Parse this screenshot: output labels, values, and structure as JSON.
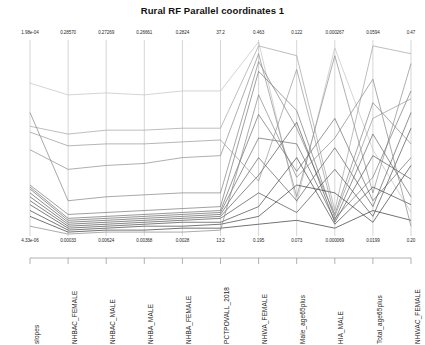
{
  "chart": {
    "title": "Rural RF Parallel coordinates 1"
  },
  "chart_data": {
    "type": "line",
    "subtype": "parallel-coordinates",
    "title": "Rural RF Parallel coordinates 1",
    "xlabel": "",
    "ylabel": "",
    "grid": false,
    "legend": false,
    "axes": [
      {
        "name": "slopes",
        "max": "1.98e-04",
        "min": "4.33e-06"
      },
      {
        "name": "NHBAC_FEMALE",
        "max": "0.28570",
        "min": "0.00033"
      },
      {
        "name": "NHBAC_MALE",
        "max": "0.27269",
        "min": "0.00624"
      },
      {
        "name": "NHBA_MALE",
        "max": "0.26661",
        "min": "0.00368"
      },
      {
        "name": "NHBA_FEMALE",
        "max": "0.2824",
        "min": "0.0028"
      },
      {
        "name": "PCTPOVALL_2018",
        "max": "37.2",
        "min": "13.2"
      },
      {
        "name": "NHWA_FEMALE",
        "max": "0.463",
        "min": "0.195"
      },
      {
        "name": "Male_age65plus",
        "max": "0.122",
        "min": "0.073"
      },
      {
        "name": "HIA_MALE",
        "max": "0.000267",
        "min": "0.000069"
      },
      {
        "name": "Total_age65plus",
        "max": "0.0594",
        "min": "0.0199"
      },
      {
        "name": "NHWAC_FEMALE",
        "max": "0.47",
        "min": "0.20"
      }
    ],
    "categories": [
      "slopes",
      "NHBAC_FEMALE",
      "NHBAC_MALE",
      "NHBA_MALE",
      "NHBA_FEMALE",
      "PCTPOVALL_2018",
      "NHWA_FEMALE",
      "Male_age65plus",
      "HIA_MALE",
      "Total_age65plus",
      "NHWAC_FEMALE"
    ],
    "series": [
      {
        "name": "line-1",
        "shade": 0.2,
        "values": [
          0.78,
          0.72,
          0.73,
          0.72,
          0.74,
          0.74,
          0.99,
          0.17,
          0.96,
          0.44,
          0.12
        ]
      },
      {
        "name": "line-2",
        "shade": 0.35,
        "values": [
          0.56,
          0.52,
          0.54,
          0.54,
          0.55,
          0.55,
          0.97,
          0.92,
          0.13,
          0.97,
          0.93
        ]
      },
      {
        "name": "line-3",
        "shade": 0.45,
        "values": [
          0.44,
          0.34,
          0.36,
          0.37,
          0.4,
          0.41,
          0.93,
          0.2,
          0.92,
          0.22,
          0.88
        ]
      },
      {
        "name": "line-4",
        "shade": 0.5,
        "values": [
          0.63,
          0.18,
          0.2,
          0.21,
          0.22,
          0.22,
          0.89,
          0.55,
          0.11,
          0.68,
          0.47
        ]
      },
      {
        "name": "line-5",
        "shade": 0.55,
        "values": [
          0.26,
          0.11,
          0.12,
          0.13,
          0.14,
          0.15,
          0.84,
          0.64,
          0.09,
          0.3,
          0.74
        ]
      },
      {
        "name": "line-6",
        "shade": 0.6,
        "values": [
          0.25,
          0.09,
          0.1,
          0.11,
          0.12,
          0.13,
          0.62,
          0.33,
          0.6,
          0.18,
          0.4
        ]
      },
      {
        "name": "line-7",
        "shade": 0.62,
        "values": [
          0.24,
          0.08,
          0.09,
          0.1,
          0.11,
          0.12,
          0.5,
          0.47,
          0.08,
          0.52,
          0.2
        ]
      },
      {
        "name": "line-8",
        "shade": 0.66,
        "values": [
          0.22,
          0.07,
          0.08,
          0.09,
          0.1,
          0.11,
          0.4,
          0.18,
          0.45,
          0.15,
          0.63
        ]
      },
      {
        "name": "line-9",
        "shade": 0.7,
        "values": [
          0.2,
          0.06,
          0.07,
          0.08,
          0.09,
          0.1,
          0.31,
          0.58,
          0.07,
          0.41,
          0.29
        ]
      },
      {
        "name": "line-10",
        "shade": 0.74,
        "values": [
          0.18,
          0.05,
          0.06,
          0.07,
          0.08,
          0.09,
          0.22,
          0.12,
          0.34,
          0.1,
          0.55
        ]
      },
      {
        "name": "line-11",
        "shade": 0.78,
        "values": [
          0.16,
          0.04,
          0.05,
          0.06,
          0.07,
          0.07,
          0.15,
          0.4,
          0.06,
          0.25,
          0.16
        ]
      },
      {
        "name": "line-12",
        "shade": 0.82,
        "values": [
          0.13,
          0.03,
          0.04,
          0.05,
          0.05,
          0.06,
          0.1,
          0.26,
          0.22,
          0.07,
          0.36
        ]
      },
      {
        "name": "line-13",
        "shade": 0.86,
        "values": [
          0.1,
          0.02,
          0.03,
          0.03,
          0.04,
          0.04,
          0.06,
          0.08,
          0.04,
          0.13,
          0.08
        ]
      },
      {
        "name": "line-14",
        "shade": 0.4,
        "values": [
          0.53,
          0.46,
          0.47,
          0.47,
          0.48,
          0.49,
          0.28,
          0.85,
          0.1,
          0.6,
          0.7
        ]
      },
      {
        "name": "line-15",
        "shade": 0.48,
        "values": [
          0.05,
          0.01,
          0.02,
          0.02,
          0.02,
          0.03,
          0.72,
          0.3,
          0.5,
          0.8,
          0.05
        ]
      }
    ]
  }
}
